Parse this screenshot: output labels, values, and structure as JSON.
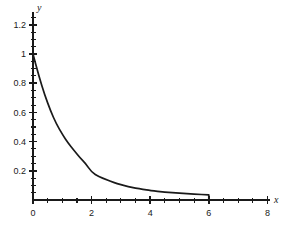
{
  "chart_data": {
    "type": "line",
    "title": "",
    "subtitle": "",
    "xlabel": "x",
    "ylabel": "y",
    "xlim": [
      0,
      8
    ],
    "ylim": [
      0,
      1.3
    ],
    "grid": false,
    "legend": null,
    "x_ticks": [
      0,
      2,
      4,
      6,
      8
    ],
    "x_tick_labels": [
      "0",
      "2",
      "4",
      "6",
      "8"
    ],
    "x_minor_tick_step": 0.5,
    "y_ticks": [
      0.2,
      0.4,
      0.6,
      0.8,
      1,
      1.2
    ],
    "y_tick_labels": [
      "0.2",
      "0.4",
      "0.6",
      "0.8",
      "1",
      "1.2"
    ],
    "y_minor_tick_step": 0.05,
    "series": [
      {
        "name": "exponential decay truncated at x = 6",
        "color": "#1a1a1a",
        "x": [
          0,
          0.2,
          0.4,
          0.6,
          0.8,
          1,
          1.2,
          1.4,
          1.6,
          1.8,
          2,
          2.25,
          2.5,
          2.75,
          3,
          3.25,
          3.5,
          3.75,
          4,
          4.5,
          5,
          5.5,
          6,
          6
        ],
        "y": [
          1,
          0.85,
          0.72,
          0.61,
          0.52,
          0.45,
          0.39,
          0.34,
          0.29,
          0.25,
          0.19,
          0.16,
          0.14,
          0.12,
          0.105,
          0.092,
          0.082,
          0.073,
          0.065,
          0.054,
          0.046,
          0.04,
          0.035,
          0
        ]
      }
    ],
    "annotations": [
      {
        "text": "curve drops vertically to the x-axis at x = 6",
        "x": 6,
        "y": 0
      }
    ]
  },
  "labels": {
    "x_axis_name": "x",
    "y_axis_name": "y"
  },
  "colors": {
    "curve": "#1a1a1a",
    "axis": "#1a1a1a",
    "background": "#ffffff"
  }
}
